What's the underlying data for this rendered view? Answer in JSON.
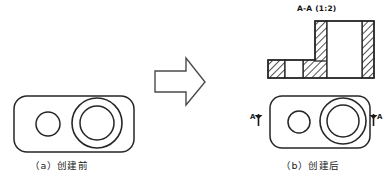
{
  "figure": {
    "kind": "engineering-drawing",
    "background_color": "#ffffff",
    "line_color": "#262626",
    "hatch_color": "#333333"
  },
  "panel_a": {
    "caption": "（a）创建前",
    "part_name": "plate-before",
    "shapes": {
      "plate": {
        "x": 14,
        "y": 96,
        "width": 120,
        "height": 56,
        "corner_radius": 13
      },
      "small_hole": {
        "cx": 48,
        "cy": 124,
        "r": 12
      },
      "big_hole_outer": {
        "cx": 97,
        "cy": 123,
        "r": 25
      },
      "big_hole_inner": {
        "cx": 97,
        "cy": 123,
        "r": 17
      }
    }
  },
  "arrow": {
    "name": "transform-arrow",
    "direction": "right",
    "points": "155,71 186,71 186,58 205,82 186,105 186,92 155,92"
  },
  "panel_b": {
    "caption": "（b）创建后",
    "part_name": "plate-after",
    "shapes": {
      "plate": {
        "x": 270,
        "y": 96,
        "width": 100,
        "height": 52,
        "corner_radius": 12
      },
      "small_hole": {
        "cx": 299,
        "cy": 122,
        "r": 11
      },
      "big_hole_outer": {
        "cx": 343,
        "cy": 121,
        "r": 23
      },
      "big_hole_inner": {
        "cx": 343,
        "cy": 121,
        "r": 16
      }
    },
    "section_marks": [
      {
        "label": "A",
        "side": "left",
        "arrow": "up"
      },
      {
        "label": "A",
        "side": "right",
        "arrow": "up"
      }
    ]
  },
  "section_view": {
    "title": "A-A (1:2)",
    "scale": "1:2",
    "label": "A-A",
    "geometry": {
      "base": {
        "x": 268,
        "y": 60,
        "width": 106,
        "height": 18
      },
      "boss": {
        "x": 315,
        "y": 21,
        "width": 59,
        "height": 39
      },
      "solid_regions": [
        {
          "name": "base-left-wall",
          "x": 268,
          "y": 60,
          "width": 17,
          "height": 18
        },
        {
          "name": "base-mid-wall",
          "x": 303,
          "y": 60,
          "width": 24,
          "height": 18
        },
        {
          "name": "boss-left-wall",
          "x": 315,
          "y": 21,
          "width": 12,
          "height": 39
        },
        {
          "name": "boss-right-wall",
          "x": 362,
          "y": 21,
          "width": 12,
          "height": 57
        }
      ],
      "void_regions": [
        {
          "name": "small-hole-void",
          "x": 285,
          "y": 60,
          "width": 18,
          "height": 18
        },
        {
          "name": "big-hole-void",
          "x": 327,
          "y": 21,
          "width": 35,
          "height": 57
        }
      ]
    }
  }
}
